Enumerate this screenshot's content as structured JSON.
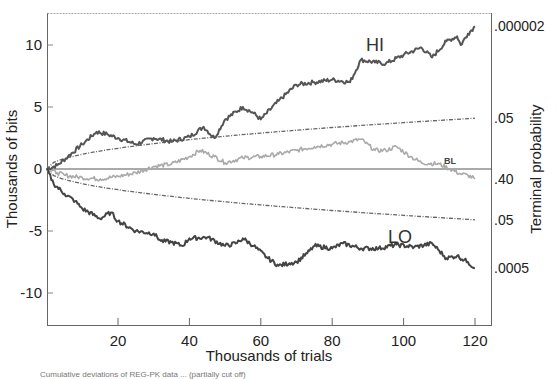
{
  "chart_data": {
    "type": "line",
    "title": "",
    "xlabel": "Thousands of trials",
    "ylabel": "Thousands of bits",
    "y2label": "Terminal probability",
    "xlim": [
      0,
      124
    ],
    "ylim": [
      -12.5,
      12.5
    ],
    "x_ticks": [
      20,
      40,
      60,
      80,
      100,
      120
    ],
    "y_ticks": [
      10,
      5,
      0,
      -5,
      -10
    ],
    "grid": false,
    "legend": "inline labels",
    "right_axis_labels": [
      {
        "label": ".000002",
        "y": 11.5
      },
      {
        "label": ".05",
        "y": 4.1
      },
      {
        "label": ".40",
        "y": -0.8
      },
      {
        "label": ".05",
        "y": -4.1
      },
      {
        "label": ".0005",
        "y": -8.0
      }
    ],
    "series": [
      {
        "name": "HI",
        "label_pos": [
          92,
          9.5
        ],
        "color": "#555555",
        "x": [
          0,
          3,
          6,
          10,
          14,
          17,
          20,
          25,
          30,
          35,
          40,
          44,
          47,
          50,
          55,
          58,
          60,
          65,
          70,
          75,
          80,
          85,
          88,
          92,
          95,
          100,
          105,
          108,
          112,
          115,
          116,
          118,
          120
        ],
        "values": [
          0,
          0.3,
          1.0,
          2.0,
          3.0,
          2.8,
          2.5,
          2.0,
          2.5,
          2.2,
          2.6,
          3.4,
          2.5,
          4.0,
          5.0,
          4.5,
          4.0,
          5.5,
          6.8,
          7.0,
          7.2,
          7.0,
          8.8,
          8.6,
          8.5,
          9.2,
          9.8,
          9.0,
          10.3,
          10.7,
          10.0,
          10.9,
          11.5
        ]
      },
      {
        "name": "BL",
        "label_pos": [
          113,
          0.4
        ],
        "color": "#aaaaaa",
        "x": [
          0,
          3,
          5,
          10,
          15,
          20,
          25,
          30,
          35,
          40,
          43,
          47,
          50,
          55,
          60,
          65,
          70,
          75,
          80,
          85,
          88,
          92,
          95,
          98,
          102,
          105,
          110,
          113,
          116,
          118,
          120
        ],
        "values": [
          0,
          -0.3,
          -0.5,
          -0.7,
          -0.8,
          -0.6,
          -0.3,
          0.2,
          0.4,
          1.0,
          1.5,
          1.0,
          0.5,
          0.9,
          1.0,
          1.2,
          1.5,
          1.8,
          2.0,
          2.2,
          2.4,
          1.5,
          1.5,
          1.8,
          1.0,
          0.5,
          0.4,
          0.0,
          -0.4,
          -0.5,
          -0.8
        ]
      },
      {
        "name": "LO",
        "label_pos": [
          99,
          -6.0
        ],
        "color": "#444444",
        "x": [
          0,
          2,
          5,
          8,
          10,
          15,
          18,
          20,
          25,
          30,
          32,
          35,
          38,
          40,
          45,
          50,
          53,
          55,
          58,
          62,
          65,
          68,
          70,
          73,
          75,
          80,
          83,
          88,
          93,
          98,
          103,
          108,
          110,
          112,
          115,
          118,
          120
        ],
        "values": [
          0,
          -1.2,
          -2.0,
          -2.6,
          -3.2,
          -4.0,
          -3.5,
          -4.2,
          -5.0,
          -5.2,
          -5.8,
          -5.9,
          -6.2,
          -5.6,
          -5.5,
          -6.2,
          -6.0,
          -5.6,
          -6.2,
          -7.2,
          -7.8,
          -7.6,
          -7.5,
          -6.8,
          -6.2,
          -6.4,
          -6.0,
          -6.4,
          -6.4,
          -6.1,
          -6.3,
          -6.0,
          -6.6,
          -7.2,
          -7.0,
          -7.5,
          -8.0
        ]
      }
    ],
    "envelopes": [
      {
        "name": "+0.05 criterion",
        "style": "dash-dot",
        "color": "#666666",
        "x": [
          0,
          10,
          20,
          40,
          60,
          80,
          100,
          120
        ],
        "values": [
          0,
          1.2,
          1.7,
          2.4,
          2.9,
          3.4,
          3.75,
          4.1
        ]
      },
      {
        "name": "-0.05 criterion",
        "style": "dash-dot",
        "color": "#666666",
        "x": [
          0,
          10,
          20,
          40,
          60,
          80,
          100,
          120
        ],
        "values": [
          0,
          -1.2,
          -1.7,
          -2.4,
          -2.9,
          -3.4,
          -3.75,
          -4.1
        ]
      }
    ]
  },
  "caption": "Cumulative deviations of REG-PK data ... (partially cut off)"
}
